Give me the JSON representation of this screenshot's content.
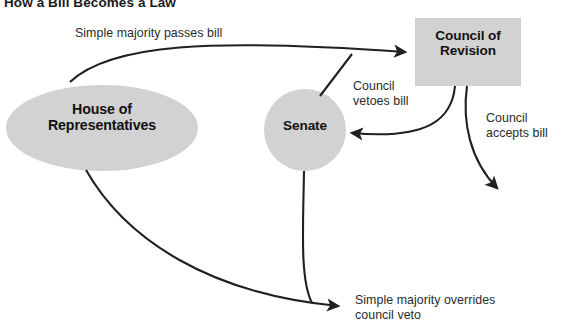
{
  "diagram": {
    "title": "How a Bill Becomes a Law",
    "colors": {
      "shape_fill": "#d2d2d2",
      "stroke": "#231f20",
      "text": "#111111",
      "label_text": "#2b2b2b",
      "background": "#ffffff"
    },
    "nodes": [
      {
        "id": "house",
        "label": "House of\nRepresentatives",
        "shape": "ellipse"
      },
      {
        "id": "senate",
        "label": "Senate",
        "shape": "circle"
      },
      {
        "id": "council",
        "label": "Council of\nRevision",
        "shape": "rectangle"
      }
    ],
    "edges": [
      {
        "id": "passes",
        "label": "Simple majority passes bill",
        "from": "house",
        "to": "council"
      },
      {
        "id": "senate-to-council",
        "label": "",
        "from": "senate",
        "to": "council"
      },
      {
        "id": "vetoes",
        "label": "Council\nvetoes bill",
        "from": "council",
        "to": "senate"
      },
      {
        "id": "accepts",
        "label": "Council\naccepts bill",
        "from": "council",
        "to": ""
      },
      {
        "id": "overrides",
        "label": "Simple majority overrides\ncouncil veto",
        "from": "house",
        "to": ""
      }
    ]
  }
}
